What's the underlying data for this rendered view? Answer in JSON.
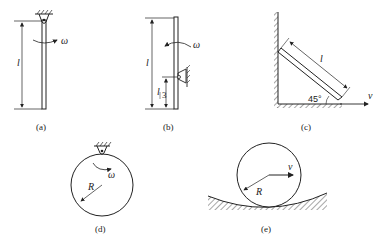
{
  "figures": [
    {
      "id": "a",
      "caption": "(a)",
      "length_label": "l",
      "angular_label": "ω",
      "description": "Rod hinged at top end, rotating with angular velocity ω"
    },
    {
      "id": "b",
      "caption": "(b)",
      "length_label": "l",
      "offset_label_num": "l",
      "offset_label_den": "3",
      "angular_label": "ω",
      "description": "Rod hinged at l/3 from bottom, rotating with ω"
    },
    {
      "id": "c",
      "caption": "(c)",
      "length_label": "l",
      "angle_label": "45°",
      "velocity_label": "v",
      "description": "Rod sliding against wall and floor at 45°, bottom end velocity v"
    },
    {
      "id": "d",
      "caption": "(d)",
      "radius_label": "R",
      "angular_label": "ω",
      "description": "Disk hinged at rim, rotating with ω"
    },
    {
      "id": "e",
      "caption": "(e)",
      "radius_label": "R",
      "velocity_label": "v",
      "description": "Disk rolling on a concave curved surface, center velocity v"
    }
  ],
  "colors": {
    "ink": "#222222",
    "background": "#ffffff"
  }
}
